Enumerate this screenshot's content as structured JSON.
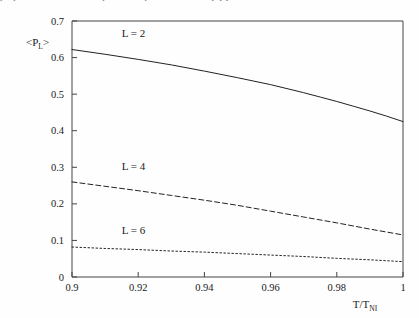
{
  "figure": {
    "clipped_caption_above": "properties of the nematic phase computed numerically [ ]",
    "background_color": "#fefefe",
    "line_color": "#222222",
    "axis_color": "#444444"
  },
  "chart_data": {
    "type": "line",
    "title": "",
    "subtitle": "",
    "xlabel": "T/T",
    "xlabel_sub": "NI",
    "ylabel": "<P",
    "ylabel_sub": "L",
    "ylabel_close": ">",
    "xlim": [
      0.9,
      1.0
    ],
    "ylim": [
      0.0,
      0.7
    ],
    "xticks": [
      "0.9",
      "0.92",
      "0.94",
      "0.96",
      "0.98",
      "1"
    ],
    "xtick_values": [
      0.9,
      0.92,
      0.94,
      0.96,
      0.98,
      1.0
    ],
    "yticks": [
      "0",
      "0.1",
      "0.2",
      "0.3",
      "0.4",
      "0.5",
      "0.6",
      "0.7"
    ],
    "ytick_values": [
      0,
      0.1,
      0.2,
      0.3,
      0.4,
      0.5,
      0.6,
      0.7
    ],
    "grid": false,
    "legend": "inline-labels",
    "series": [
      {
        "name": "L = 2",
        "style": "solid",
        "label_x": 0.915,
        "label_y": 0.655,
        "x": [
          0.9,
          0.91,
          0.92,
          0.93,
          0.94,
          0.95,
          0.96,
          0.97,
          0.975,
          0.98,
          0.985,
          0.99,
          0.995,
          1.0
        ],
        "values": [
          0.622,
          0.609,
          0.595,
          0.58,
          0.563,
          0.545,
          0.526,
          0.504,
          0.492,
          0.48,
          0.467,
          0.454,
          0.44,
          0.425
        ]
      },
      {
        "name": "L = 4",
        "style": "dashed",
        "label_x": 0.915,
        "label_y": 0.292,
        "x": [
          0.9,
          0.91,
          0.92,
          0.93,
          0.94,
          0.95,
          0.96,
          0.97,
          0.98,
          0.99,
          1.0
        ],
        "values": [
          0.26,
          0.248,
          0.236,
          0.223,
          0.21,
          0.196,
          0.18,
          0.164,
          0.148,
          0.131,
          0.115
        ]
      },
      {
        "name": "L = 6",
        "style": "dotted",
        "label_x": 0.915,
        "label_y": 0.118,
        "x": [
          0.9,
          0.91,
          0.92,
          0.93,
          0.94,
          0.95,
          0.96,
          0.97,
          0.98,
          0.99,
          1.0
        ],
        "values": [
          0.082,
          0.078,
          0.075,
          0.071,
          0.068,
          0.064,
          0.06,
          0.056,
          0.051,
          0.047,
          0.042
        ]
      }
    ]
  }
}
